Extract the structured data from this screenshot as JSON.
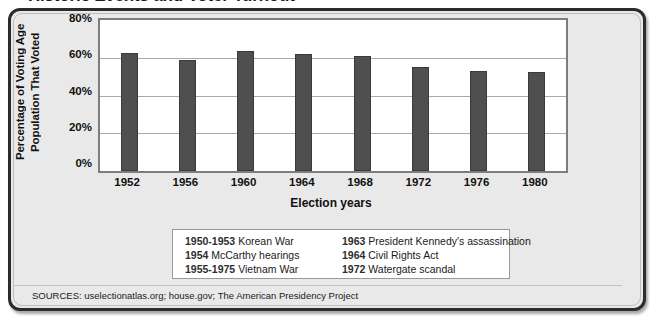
{
  "figure": {
    "title": "Historic Events and Voter Turnout",
    "sources": "SOURCES: uselectionatlas.org; house.gov; The American Presidency Project"
  },
  "chart_data": {
    "type": "bar",
    "title": "Historic Events and Voter Turnout",
    "xlabel": "Election years",
    "ylabel": "Percentage of Voting Age Population That Voted",
    "ylabel_line1": "Percentage of Voting Age",
    "ylabel_line2": "Population That Voted",
    "categories": [
      "1952",
      "1956",
      "1960",
      "1964",
      "1968",
      "1972",
      "1976",
      "1980"
    ],
    "values": [
      62.3,
      59.0,
      63.8,
      62.0,
      60.8,
      55.0,
      53.0,
      52.5
    ],
    "ylim": [
      0,
      80
    ],
    "ytick_values": [
      0,
      20,
      40,
      60,
      80
    ],
    "ytick_labels": [
      "0%",
      "20%",
      "40%",
      "60%",
      "80%"
    ],
    "grid": true,
    "legend": "none",
    "bar_color": "#4f4f4f",
    "plot_background": "#ffffff",
    "panel_background": "#e9e9e9"
  },
  "notes": {
    "left_column": [
      {
        "year": "1950-1953",
        "text": "Korean War"
      },
      {
        "year": "1954",
        "text": "McCarthy hearings"
      },
      {
        "year": "1955-1975",
        "text": "Vietnam War"
      }
    ],
    "right_column": [
      {
        "year": "1963",
        "text": "President Kennedy's assassination"
      },
      {
        "year": "1964",
        "text": "Civil Rights Act"
      },
      {
        "year": "1972",
        "text": "Watergate scandal"
      }
    ]
  }
}
